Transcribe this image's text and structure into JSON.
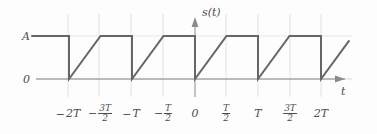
{
  "figure": {
    "caption_axis_y": "s(t)",
    "caption_axis_x": "t"
  },
  "labels": {
    "level_high": "A",
    "level_zero": "0",
    "zero_tick": "0",
    "minus": "−",
    "T": "T",
    "two_T": "2T",
    "three_T": "3T",
    "den_2": "2"
  },
  "chart_data": {
    "type": "line",
    "title": "",
    "xlabel": "t",
    "ylabel": "s(t)",
    "xlim": [
      -2.6,
      2.45
    ],
    "ylim": [
      -0.22,
      1.32
    ],
    "grid": true,
    "grid_axis": "x",
    "legend": false,
    "units": {
      "x": "T",
      "y": "A"
    },
    "x_tick_values": [
      -2,
      -1.5,
      -1,
      -0.5,
      0,
      0.5,
      1,
      1.5,
      2
    ],
    "x_tick_labels": [
      "−2T",
      "−3T/2",
      "−T",
      "−T/2",
      "0",
      "T/2",
      "T",
      "3T/2",
      "2T"
    ],
    "y_tick_values": [
      0,
      1
    ],
    "y_tick_labels": [
      "0",
      "A"
    ],
    "period": 1,
    "amplitude": 1,
    "series": [
      {
        "name": "s(t)",
        "color": "#666666",
        "x": [
          -2.6,
          -2.0,
          -2.0,
          -1.5,
          -1.0,
          -1.0,
          -0.5,
          0.0,
          0.0,
          0.5,
          1.0,
          1.0,
          1.5,
          2.0,
          2.0,
          2.45
        ],
        "y": [
          1.0,
          1.0,
          0.0,
          1.0,
          1.0,
          0.0,
          1.0,
          1.0,
          0.0,
          1.0,
          1.0,
          0.0,
          1.0,
          1.0,
          0.0,
          0.9
        ]
      }
    ]
  }
}
